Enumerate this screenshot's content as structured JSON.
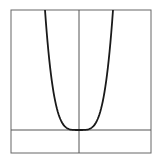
{
  "chart_data": {
    "type": "line",
    "title": "",
    "xlabel": "",
    "ylabel": "",
    "grid": false,
    "legend": null,
    "series": [
      {
        "name": "y = x^4",
        "x": [
          -1.0,
          -0.9,
          -0.8,
          -0.7,
          -0.6,
          -0.5,
          -0.4,
          -0.3,
          -0.2,
          -0.1,
          0,
          0.1,
          0.2,
          0.3,
          0.4,
          0.5,
          0.6,
          0.7,
          0.8,
          0.9,
          1.0
        ],
        "y": [
          1.0,
          0.6561,
          0.4096,
          0.2401,
          0.1296,
          0.0625,
          0.0256,
          0.0081,
          0.0016,
          0.0001,
          0,
          0.0001,
          0.0016,
          0.0081,
          0.0256,
          0.0625,
          0.1296,
          0.2401,
          0.4096,
          0.6561,
          1.0
        ]
      }
    ],
    "xlim": [
      -2,
      2
    ],
    "ylim": [
      -0.2,
      1.0
    ]
  },
  "colors": {
    "curve": "#1a1a1a",
    "axes": "#555555",
    "frame": "#666666"
  }
}
